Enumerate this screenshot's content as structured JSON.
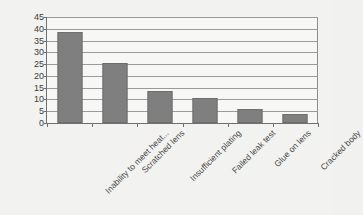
{
  "chart_data": {
    "type": "bar",
    "title": "",
    "subtitle": "",
    "xlabel": "",
    "ylabel": "",
    "categories": [
      "Inability to meet heat...",
      "Scratched lens",
      "Insufficient plating",
      "Failed leak test",
      "Glue on lens",
      "Cracked body"
    ],
    "values": [
      38.5,
      25.5,
      13.5,
      10.5,
      6,
      4
    ],
    "ylim": [
      0,
      45
    ],
    "ytick_labels": [
      "45",
      "40",
      "35",
      "30",
      "25",
      "20",
      "15",
      "10",
      "5",
      "0"
    ],
    "ytick_values": [
      45,
      40,
      35,
      30,
      25,
      20,
      15,
      10,
      5,
      0
    ],
    "ytick_step": 5,
    "grid": "horizontal",
    "legend": "none",
    "series": [
      {
        "name": "Defect count",
        "values": [
          38.5,
          25.5,
          13.5,
          10.5,
          6,
          4
        ],
        "color": "#7f7f7f"
      }
    ],
    "colors": {
      "bar": "#7f7f7f",
      "bar_border": "#6e6e6e",
      "gridline": "#9a9a9a",
      "axis": "#6f6f6f",
      "plot_background": "#f7f7f5",
      "canvas_background": "#f2f2f0",
      "tick_text": "#3b3b3b",
      "label_text": "#4a4a4a"
    }
  }
}
